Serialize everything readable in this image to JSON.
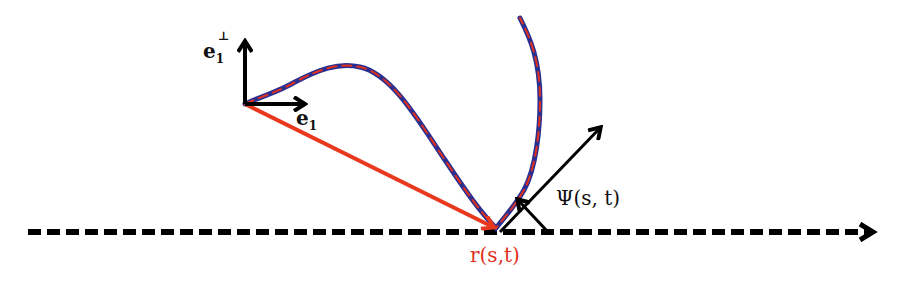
{
  "figure": {
    "labels": {
      "e1_perp": {
        "base": "e",
        "sub": "1",
        "sup": "⊥"
      },
      "e1": {
        "base": "e",
        "sub": "1"
      },
      "psi": "Ψ(s, t)",
      "r": "r(s,t)"
    },
    "colors": {
      "curve_outline": "#2b2f8f",
      "curve_dash": "#e0301e",
      "position_vector": "#e8391f",
      "frame_arrows": "#000000",
      "baseline": "#000000",
      "label_r": "#e0301e",
      "label_default": "#111111"
    },
    "geometry": {
      "frame_origin": [
        245,
        104
      ],
      "e1_perp_tip": [
        245,
        40
      ],
      "e1_tip": [
        306,
        104
      ],
      "contact_point": [
        496,
        228
      ],
      "psi_arrow_tip": [
        600,
        127
      ],
      "baseline": {
        "y": 232,
        "x_start": 28,
        "x_end": 876
      },
      "curve_top": [
        520,
        18
      ],
      "curve_peak": [
        345,
        65
      ]
    }
  }
}
